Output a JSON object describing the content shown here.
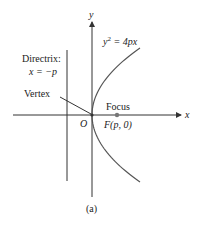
{
  "diagram": {
    "type": "parabola",
    "axis_labels": {
      "x": "x",
      "y": "y"
    },
    "equation": {
      "lhs": "y",
      "exp": "2",
      "rhs": " = 4px"
    },
    "directrix": {
      "title": "Directrix:",
      "equation": "x = −p"
    },
    "vertex_label": "Vertex",
    "origin_label": "O",
    "focus_label": "Focus",
    "focus_coord": "F(p, 0)",
    "caption": "(a)",
    "colors": {
      "axes": "#333333",
      "curve": "#555555",
      "focus_point": "#777777"
    }
  }
}
